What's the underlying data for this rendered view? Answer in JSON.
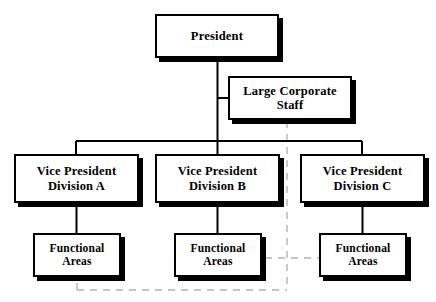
{
  "diagram": {
    "background_color": "#ffffff",
    "line_color": "#000000",
    "dashed_line_color": "#b3b3b3",
    "box_fill_color": "#ffffff",
    "box_border_color": "#000000",
    "shadow_color": "#000000"
  },
  "nodes": {
    "president": {
      "label": "President",
      "level": 1
    },
    "staff": {
      "label": "Large Corporate\nStaff",
      "level": 2
    },
    "vp_a": {
      "label": "Vice President\nDivision A",
      "level": 3
    },
    "vp_b": {
      "label": "Vice President\nDivision B",
      "level": 3
    },
    "vp_c": {
      "label": "Vice President\nDivision C",
      "level": 3
    },
    "fa_a": {
      "label": "Functional\nAreas",
      "level": 4
    },
    "fa_b": {
      "label": "Functional\nAreas",
      "level": 4
    },
    "fa_c": {
      "label": "Functional\nAreas",
      "level": 4
    }
  },
  "connectors": {
    "president_to_bus": "solid",
    "president_to_staff": "solid",
    "bus_to_vps": "solid",
    "vp_to_functional_areas": "solid",
    "staff_dashed_vertical": "dashed",
    "functional_areas_dashed_horizontal": "dashed",
    "bottom_dashed_horizontal": "dashed"
  }
}
